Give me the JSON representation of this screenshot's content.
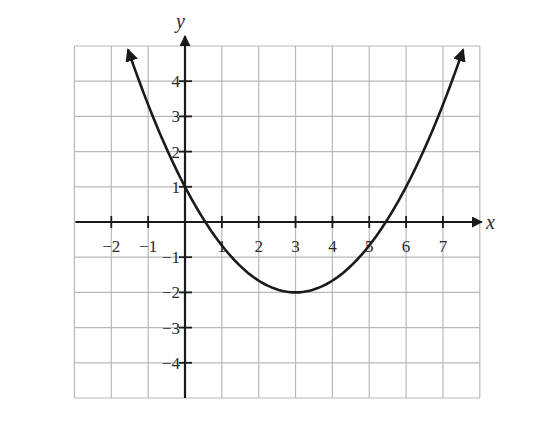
{
  "chart_data": {
    "type": "line",
    "title": "",
    "xlabel": "x",
    "ylabel": "y",
    "xlim": [
      -3,
      8
    ],
    "ylim": [
      -5,
      5
    ],
    "grid": true,
    "legend": null,
    "x_ticks": [
      -2,
      -1,
      1,
      2,
      3,
      4,
      5,
      6,
      7
    ],
    "y_ticks": [
      4,
      3,
      2,
      1,
      -1,
      -2,
      -3,
      -4
    ],
    "x_tick_labels": [
      "−2",
      "−1",
      "1",
      "2",
      "3",
      "4",
      "5",
      "6",
      "7"
    ],
    "y_tick_labels": [
      "4",
      "3",
      "2",
      "1",
      "−1",
      "−2",
      "−3",
      "−4"
    ],
    "series": [
      {
        "name": "parabola",
        "equation": "y = (1/3)(x - 3)^2 - 2",
        "vertex": [
          3,
          -2
        ],
        "y_intercept": [
          0,
          1
        ],
        "x_intercepts": [
          0.55,
          5.45
        ],
        "domain_shown": [
          -1.55,
          7.55
        ],
        "arrows_at_ends": true,
        "x": [
          -1.5,
          -1,
          0,
          1,
          2,
          3,
          4,
          5,
          6,
          7,
          7.5
        ],
        "y": [
          4.75,
          3.33,
          1,
          -0.67,
          -1.67,
          -2,
          -1.67,
          -0.67,
          1,
          3.33,
          4.75
        ],
        "color": "#1a1a1a"
      }
    ]
  },
  "colors": {
    "grid": "#b8b8b8",
    "axis": "#1a1a1a",
    "curve": "#1a1a1a",
    "background": "#ffffff"
  }
}
